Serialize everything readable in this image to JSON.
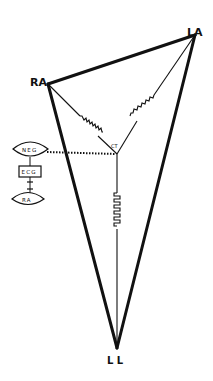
{
  "diagram": {
    "title": "",
    "vertices": {
      "RA": {
        "label": "RA",
        "x": 48,
        "y": 84
      },
      "LA": {
        "label": "LA",
        "x": 195,
        "y": 35
      },
      "LL": {
        "label": "L L",
        "x": 117,
        "y": 348
      },
      "CT": {
        "label": "CT",
        "x": 117,
        "y": 154
      }
    },
    "resistors": [
      {
        "from": "RA",
        "to": "CT",
        "label": ""
      },
      {
        "from": "LA",
        "to": "CT",
        "label": ""
      },
      {
        "from": "CT",
        "to": "LL",
        "label": ""
      }
    ],
    "ecg_module": {
      "neg_label": "NEG",
      "ecg_label": "ECG",
      "plus_symbol": "+",
      "ra_label": "RA"
    },
    "connections": [
      {
        "from": "NEG",
        "to": "CT",
        "style": "dotted"
      }
    ],
    "colors": {
      "line": "#111111",
      "background": "#ffffff"
    }
  }
}
